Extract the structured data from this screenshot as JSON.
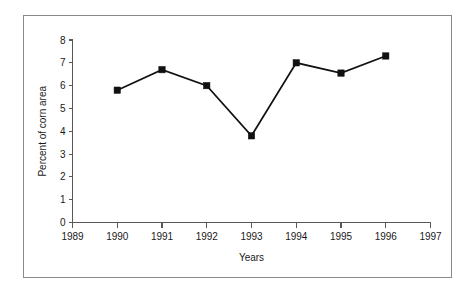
{
  "chart_data": {
    "type": "line",
    "title": "",
    "xlabel": "Years",
    "ylabel": "Percent of corn area",
    "x": [
      1990,
      1991,
      1992,
      1993,
      1994,
      1995,
      1996
    ],
    "values": [
      5.8,
      6.7,
      6.0,
      3.8,
      7.0,
      6.55,
      7.3
    ],
    "series": [
      {
        "name": "Percent of corn area",
        "values": [
          5.8,
          6.7,
          6.0,
          3.8,
          7.0,
          6.55,
          7.3
        ]
      }
    ],
    "xlim": [
      1989,
      1997
    ],
    "ylim": [
      0,
      8
    ],
    "xticks": [
      1989,
      1990,
      1991,
      1992,
      1993,
      1994,
      1995,
      1996,
      1997
    ],
    "xtick_labels": [
      "1989",
      "1990",
      "1991",
      "1992",
      "1993",
      "1994",
      "1995",
      "1996",
      "1997"
    ],
    "yticks": [
      0,
      1,
      2,
      3,
      4,
      5,
      6,
      7,
      8
    ],
    "ytick_labels": [
      "0",
      "1",
      "2",
      "3",
      "4",
      "5",
      "6",
      "7",
      "8"
    ],
    "grid": false,
    "legend": false,
    "legend_position": "none",
    "marker": "square",
    "line_color": "#111111",
    "marker_color": "#111111",
    "axis_color": "#58585a",
    "frame_color": "#8a8a8a",
    "background_color": "#ffffff"
  }
}
